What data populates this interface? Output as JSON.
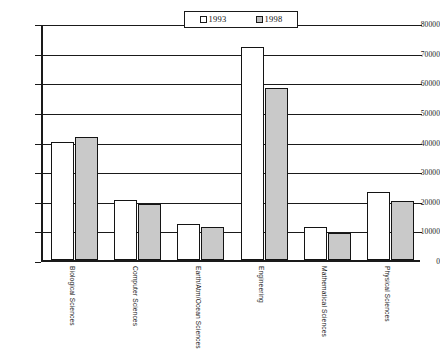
{
  "chart_data": {
    "type": "bar",
    "title": "",
    "subtitle": "",
    "xlabel": "",
    "ylabel": "",
    "ylim": [
      0,
      80000
    ],
    "ytick_values": [
      0,
      10000,
      20000,
      30000,
      40000,
      50000,
      60000,
      70000,
      80000
    ],
    "ytick_labels": [
      "0",
      "10000",
      "20000",
      "30000",
      "40000",
      "50000",
      "60000",
      "70000",
      "80000"
    ],
    "grid": "horizontal",
    "legend_position": "top-center",
    "categories": [
      "Biological Sciences",
      "Computer Sciences",
      "Earth/Atm/Ocean Sciences",
      "Engineering",
      "Mathematical Sciences",
      "Physical Sciences"
    ],
    "series": [
      {
        "name": "1993",
        "color": "#ffffff",
        "values": [
          40000,
          20300,
          12000,
          72000,
          11000,
          23000
        ]
      },
      {
        "name": "1998",
        "color": "#c9c9c9",
        "values": [
          41500,
          19000,
          11000,
          58000,
          9000,
          20000
        ]
      }
    ]
  },
  "legend": {
    "items": [
      {
        "label": "1993",
        "swatch": "white-square-icon"
      },
      {
        "label": "1998",
        "swatch": "gray-square-icon"
      }
    ]
  },
  "colors": {
    "axis": "#1a1a1a",
    "grid": "#1a1a1a",
    "bar_1993": "#ffffff",
    "bar_1998": "#c9c9c9",
    "background": "#ffffff"
  }
}
